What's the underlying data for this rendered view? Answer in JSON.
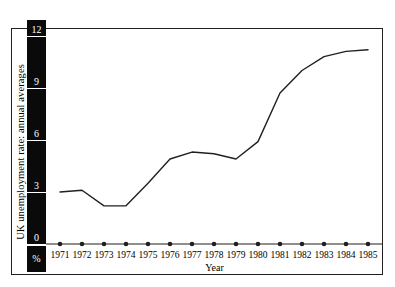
{
  "chart_data": {
    "type": "line",
    "title": "",
    "ylabel": "UK unemployment rate: annual averages",
    "xlabel": "Year",
    "yunit": "%",
    "categories": [
      "1971",
      "1972",
      "1973",
      "1974",
      "1975",
      "1976",
      "1977",
      "1978",
      "1979",
      "1980",
      "1981",
      "1982",
      "1983",
      "1984",
      "1985"
    ],
    "values": [
      3.0,
      3.1,
      2.2,
      2.2,
      3.5,
      4.9,
      5.3,
      5.2,
      4.9,
      5.9,
      8.7,
      10.0,
      10.8,
      11.1,
      11.2
    ],
    "series": [
      {
        "name": "UK unemployment rate: annual averages",
        "values": [
          3.0,
          3.1,
          2.2,
          2.2,
          3.5,
          4.9,
          5.3,
          5.2,
          4.9,
          5.9,
          8.7,
          10.0,
          10.8,
          11.1,
          11.2
        ]
      }
    ],
    "ylim": [
      0,
      12.6
    ],
    "xlim": [
      "1971",
      "1985"
    ],
    "yticks": [
      "12",
      "9",
      "6",
      "3",
      "0"
    ],
    "ytick_values": [
      12,
      9,
      6,
      3,
      0
    ],
    "grid": false,
    "legend": "none",
    "line_color": "#231f20",
    "axis_bar_color": "#0a0a0a",
    "axis_label_color": "#ffffff",
    "frame_color": "#231f20",
    "background": "#ffffff"
  },
  "axis": {
    "y_title": "UK unemployment rate: annual averages",
    "y_unit_label": "%",
    "x_title": "Year",
    "y_tick_labels": [
      "12",
      "9",
      "6",
      "3",
      "0"
    ]
  }
}
